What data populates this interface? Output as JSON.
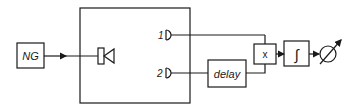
{
  "diagram": {
    "type": "block-diagram",
    "blocks": {
      "noise_generator": {
        "label": "NG"
      },
      "room": {
        "label": ""
      },
      "speaker": {
        "icon": "loudspeaker-icon"
      },
      "mic1": {
        "label": "1",
        "icon": "microphone-icon"
      },
      "mic2": {
        "label": "2",
        "icon": "microphone-icon"
      },
      "delay": {
        "label": "delay"
      },
      "multiplier": {
        "label": "x"
      },
      "integrator": {
        "label": "∫"
      },
      "meter": {
        "icon": "meter-icon"
      }
    },
    "connections": [
      [
        "NG",
        "speaker"
      ],
      [
        "mic1",
        "multiplier"
      ],
      [
        "mic2",
        "delay"
      ],
      [
        "delay",
        "multiplier"
      ],
      [
        "multiplier",
        "integrator"
      ],
      [
        "integrator",
        "meter"
      ]
    ],
    "colors": {
      "stroke": "#1a1a1a",
      "background": "#ffffff"
    }
  }
}
